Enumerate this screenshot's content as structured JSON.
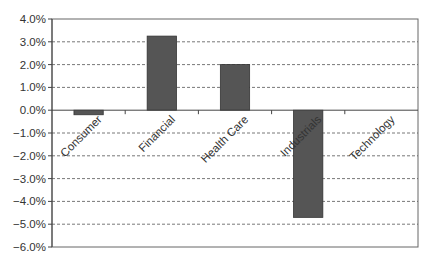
{
  "chart_data": {
    "type": "bar",
    "title": "",
    "xlabel": "",
    "ylabel": "",
    "categories": [
      "Consumer",
      "Financial",
      "Health Care",
      "Industrials",
      "Technology"
    ],
    "values": [
      -0.2,
      3.25,
      2.0,
      -4.7,
      0.0
    ],
    "value_format": "percent",
    "ylim": [
      -6.0,
      4.0
    ],
    "yticks": [
      4.0,
      3.0,
      2.0,
      1.0,
      0.0,
      -1.0,
      -2.0,
      -3.0,
      -4.0,
      -5.0,
      -6.0
    ],
    "ytick_labels": [
      "4.0%",
      "3.0%",
      "2.0%",
      "1.0%",
      "0.0%",
      "-1.0%",
      "-2.0%",
      "-3.0%",
      "-4.0%",
      "-5.0%",
      "-6.0%"
    ],
    "grid": "horizontal dashed",
    "legend": null,
    "bar_color": "#555555",
    "category_label_rotation": -45
  }
}
